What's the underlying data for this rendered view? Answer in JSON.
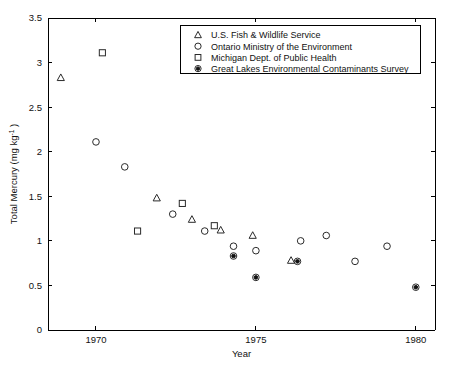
{
  "chart_data": {
    "type": "scatter",
    "title": "",
    "xlabel": "Year",
    "ylabel": "Total Mercury (mg kg",
    "ylabel_sup": "-1",
    "ylabel_tail": " )",
    "xlim": [
      1968.5,
      1980.6
    ],
    "ylim": [
      0,
      3.5
    ],
    "xticks": [
      1970,
      1975,
      1980
    ],
    "xticklabels": [
      "1970",
      "1975",
      "1980"
    ],
    "yticks": [
      0,
      0.5,
      1,
      1.5,
      2,
      2.5,
      3,
      3.5
    ],
    "yticklabels": [
      "0",
      "0.5",
      "1",
      "1.5",
      "2",
      "2.5",
      "3",
      "3.5"
    ],
    "grid": false,
    "legend_position": "top-center",
    "series": [
      {
        "name": "U.S. Fish & Wildlife Service",
        "marker": "triangle-open",
        "points": [
          {
            "x": 1968.9,
            "y": 2.83
          },
          {
            "x": 1971.9,
            "y": 1.48
          },
          {
            "x": 1973.0,
            "y": 1.24
          },
          {
            "x": 1973.9,
            "y": 1.12
          },
          {
            "x": 1974.9,
            "y": 1.06
          },
          {
            "x": 1976.1,
            "y": 0.78
          }
        ]
      },
      {
        "name": "Ontario Ministry of the Environment",
        "marker": "circle-open",
        "points": [
          {
            "x": 1970.0,
            "y": 2.11
          },
          {
            "x": 1970.9,
            "y": 1.83
          },
          {
            "x": 1972.4,
            "y": 1.3
          },
          {
            "x": 1973.4,
            "y": 1.11
          },
          {
            "x": 1974.3,
            "y": 0.94
          },
          {
            "x": 1975.0,
            "y": 0.89
          },
          {
            "x": 1976.4,
            "y": 1.0
          },
          {
            "x": 1977.2,
            "y": 1.06
          },
          {
            "x": 1978.1,
            "y": 0.77
          },
          {
            "x": 1979.1,
            "y": 0.94
          }
        ]
      },
      {
        "name": "Michigan Dept. of Public Health",
        "marker": "square-open",
        "points": [
          {
            "x": 1970.2,
            "y": 3.11
          },
          {
            "x": 1971.3,
            "y": 1.11
          },
          {
            "x": 1972.7,
            "y": 1.42
          },
          {
            "x": 1973.7,
            "y": 1.17
          }
        ]
      },
      {
        "name": "Great Lakes Environmental Contaminants Survey",
        "marker": "circle-filled-dot",
        "points": [
          {
            "x": 1974.3,
            "y": 0.83
          },
          {
            "x": 1975.0,
            "y": 0.59
          },
          {
            "x": 1976.3,
            "y": 0.77
          },
          {
            "x": 1980.0,
            "y": 0.48
          }
        ]
      }
    ]
  },
  "legend": {
    "entries": [
      {
        "label": "U.S. Fish & Wildlife Service",
        "marker": "triangle-open"
      },
      {
        "label": "Ontario Ministry of the Environment",
        "marker": "circle-open"
      },
      {
        "label": "Michigan Dept. of Public Health",
        "marker": "square-open"
      },
      {
        "label": "Great Lakes Environmental Contaminants Survey",
        "marker": "circle-filled-dot"
      }
    ]
  },
  "colors": {
    "axis": "#000000",
    "marker": "#1a1a1a",
    "background": "#ffffff"
  }
}
